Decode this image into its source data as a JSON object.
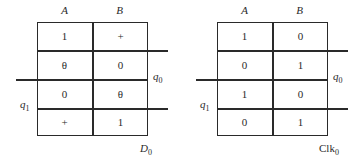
{
  "maps": [
    {
      "name": "D",
      "name_sub": "0",
      "name_italic": true,
      "columns": [
        "A",
        "B"
      ],
      "row_var_q0": {
        "label": "q",
        "sub": "0"
      },
      "row_var_q1": {
        "label": "q",
        "sub": "1"
      },
      "rows": [
        [
          "1",
          "+"
        ],
        [
          "θ",
          "0"
        ],
        [
          "0",
          "θ"
        ],
        [
          "+",
          "1"
        ]
      ]
    },
    {
      "name": "Clk",
      "name_sub": "0",
      "name_italic": false,
      "columns": [
        "A",
        "B"
      ],
      "row_var_q0": {
        "label": "q",
        "sub": "0"
      },
      "row_var_q1": {
        "label": "q",
        "sub": "1"
      },
      "rows": [
        [
          "1",
          "0"
        ],
        [
          "0",
          "1"
        ],
        [
          "1",
          "0"
        ],
        [
          "0",
          "1"
        ]
      ]
    }
  ]
}
